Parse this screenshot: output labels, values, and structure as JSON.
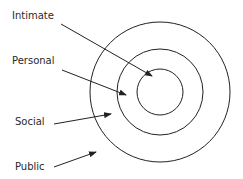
{
  "diagram": {
    "center": [
      160,
      92
    ],
    "circles": [
      {
        "name": "outer",
        "r": 70
      },
      {
        "name": "middle",
        "r": 43
      },
      {
        "name": "inner",
        "r": 23
      }
    ],
    "labels": [
      {
        "id": "intimate",
        "text": "Intimate",
        "x": 12,
        "y": 19
      },
      {
        "id": "personal",
        "text": "Personal",
        "x": 12,
        "y": 64
      },
      {
        "id": "social",
        "text": "Social",
        "x": 15,
        "y": 125
      },
      {
        "id": "public",
        "text": "Public",
        "x": 15,
        "y": 170
      }
    ],
    "arrows": [
      {
        "id": "intimate",
        "from": [
          61,
          24
        ],
        "to": [
          152,
          76
        ]
      },
      {
        "id": "personal",
        "from": [
          62,
          70
        ],
        "to": [
          126,
          95
        ]
      },
      {
        "id": "social",
        "from": [
          54,
          124
        ],
        "to": [
          111,
          114
        ]
      },
      {
        "id": "public",
        "from": [
          54,
          167
        ],
        "to": [
          96,
          152
        ]
      }
    ],
    "stroke_color": "#222222"
  }
}
